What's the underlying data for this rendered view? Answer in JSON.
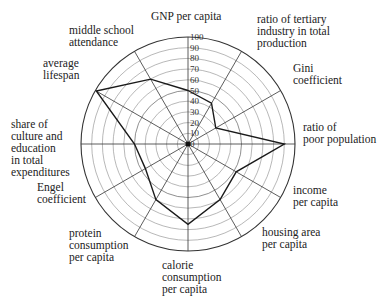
{
  "chart_data": {
    "type": "radar",
    "title": "",
    "rmax": 100,
    "rings": [
      10,
      20,
      30,
      40,
      50,
      60,
      70,
      80,
      90,
      100
    ],
    "tick_labels": [
      "0",
      "10",
      "20",
      "30",
      "40",
      "50",
      "60",
      "70",
      "80",
      "90",
      "100"
    ],
    "axes": [
      {
        "label": "GNP per capita",
        "angle": 90,
        "value": 50
      },
      {
        "label": "ratio of tertiary\nindustry in total\nproduction",
        "angle": 60,
        "value": 44
      },
      {
        "label": "Gini\ncoefficient",
        "angle": 30,
        "value": 30
      },
      {
        "label": "ratio of\npoor population",
        "angle": 0,
        "value": 90
      },
      {
        "label": "income\nper capita",
        "angle": -30,
        "value": 52
      },
      {
        "label": "housing area\nper capita",
        "angle": -60,
        "value": 60
      },
      {
        "label": "calorie\nconsumption\nper capita",
        "angle": -90,
        "value": 75
      },
      {
        "label": "protein\nconsumption\nper capita",
        "angle": -120,
        "value": 60
      },
      {
        "label": "Engel\ncoefficient",
        "angle": -150,
        "value": 46
      },
      {
        "label": "share of\nculture and\neducation\nin total\nexpenditures",
        "angle": 180,
        "value": 50
      },
      {
        "label": "average\nlifespan",
        "angle": 150,
        "value": 99
      },
      {
        "label": "middle school\nattendance",
        "angle": 120,
        "value": 70
      }
    ],
    "series": [
      {
        "name": "indicators",
        "values": [
          50,
          44,
          30,
          90,
          52,
          60,
          75,
          60,
          46,
          50,
          99,
          70
        ]
      }
    ],
    "grid": true,
    "legend": "none"
  },
  "labels": [
    {
      "text": "GNP per capita",
      "x": 151,
      "y": 10
    },
    {
      "text": "ratio of tertiary\nindustry in total\nproduction",
      "x": 257,
      "y": 13
    },
    {
      "text": "Gini\ncoefficient",
      "x": 293,
      "y": 62
    },
    {
      "text": "ratio of\npoor population",
      "x": 303,
      "y": 121
    },
    {
      "text": "income\nper capita",
      "x": 293,
      "y": 184
    },
    {
      "text": "housing area\nper capita",
      "x": 262,
      "y": 226
    },
    {
      "text": "calorie\nconsumption\nper capita",
      "x": 162,
      "y": 259
    },
    {
      "text": "protein\nconsumption\nper capita",
      "x": 69,
      "y": 227
    },
    {
      "text": "Engel\ncoefficient",
      "x": 37,
      "y": 181
    },
    {
      "text": "share of\nculture and\neducation\nin total\nexpenditures",
      "x": 11,
      "y": 118
    },
    {
      "text": "average\nlifespan",
      "x": 43,
      "y": 57
    },
    {
      "text": "middle school\nattendance",
      "x": 69,
      "y": 24
    }
  ],
  "colors": {
    "line": "#1a1a1a",
    "grid": "#555555",
    "ring_minor": "#777777"
  }
}
